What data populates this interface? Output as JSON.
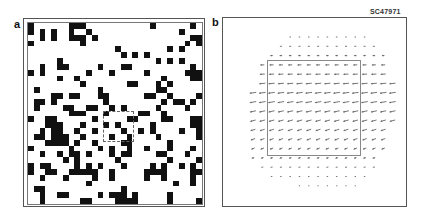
{
  "figure": {
    "id_label": "SC47971",
    "panels": [
      {
        "label": "a",
        "description": "binary random-dot pattern with dashed region",
        "grid": {
          "cols": 30,
          "rows": 31,
          "rows_data": [
            "100000011100000000000100000010",
            "101010010010000000000000001000",
            "001010011101000000000000000011",
            "100000000100000000000000000101",
            "000000000000000100000000101000",
            "000000000000000010101000000000",
            "000001000000000000000010101000",
            "001001100000100011000000000010",
            "101000000010001000001000000111",
            "000001001000000000000001000011",
            "000000000100000001100010100000",
            "010000000000100000000011000000",
            "000011011000110000001100100001",
            "011010000000010000000001011010",
            "010000110011001010000010000100",
            "000000011100010000011001000000",
            "100110000001000001100001100011",
            "000111000100010100000100000011",
            "001011001001000010010100001001",
            "011011100100001001000010000001",
            "000111101001000011000000100000",
            "100000010000101001001000100010",
            "001001011010001011000011000100",
            "000000101000000100000000100001",
            "101100001010100010000101001010",
            "100110011111001000001111000011",
            "001000100001001000001001000010",
            "000000000010000000000000010010",
            "011000000000000010000000000000",
            "001001100000101110100000100000",
            "001000000110000111100000100001"
          ],
          "roi": {
            "col": 13,
            "row": 15,
            "cols": 5,
            "rows": 5,
            "style": "dashed"
          }
        }
      },
      {
        "label": "b",
        "description": "vector field of displacement arrows pointing left, with solid square region",
        "field": {
          "spacing": 9.3,
          "origin_x": 253,
          "origin_y": 37,
          "rows": [
            {
              "start": 4,
              "count": 9,
              "len": 1.5,
              "angle": 180
            },
            {
              "start": 3,
              "count": 11,
              "len": 2.0,
              "angle": 180
            },
            {
              "start": 2,
              "count": 13,
              "len": 2.5,
              "angle": 180
            },
            {
              "start": 1,
              "count": 14,
              "len": 4.0,
              "angle": 182
            },
            {
              "start": 1,
              "count": 14,
              "len": 5.0,
              "angle": 184
            },
            {
              "start": 1,
              "count": 15,
              "len": 6.0,
              "angle": 186
            },
            {
              "start": 0,
              "count": 16,
              "len": 6.5,
              "angle": 188
            },
            {
              "start": 0,
              "count": 16,
              "len": 6.5,
              "angle": 190
            },
            {
              "start": 0,
              "count": 16,
              "len": 6.0,
              "angle": 192
            },
            {
              "start": 0,
              "count": 16,
              "len": 5.5,
              "angle": 195
            },
            {
              "start": 0,
              "count": 15,
              "len": 5.0,
              "angle": 198
            },
            {
              "start": 0,
              "count": 15,
              "len": 4.5,
              "angle": 200
            },
            {
              "start": 0,
              "count": 15,
              "len": 3.5,
              "angle": 200
            },
            {
              "start": 0,
              "count": 14,
              "len": 2.5,
              "angle": 195
            },
            {
              "start": 1,
              "count": 13,
              "len": 2.0,
              "angle": 190
            },
            {
              "start": 2,
              "count": 11,
              "len": 1.5,
              "angle": 185
            },
            {
              "start": 5,
              "count": 7,
              "len": 1.2,
              "angle": 180
            }
          ],
          "roi": {
            "x": 267,
            "y": 60,
            "w": 92,
            "h": 94,
            "style": "solid"
          }
        }
      }
    ]
  }
}
